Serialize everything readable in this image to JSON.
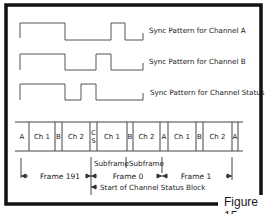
{
  "sync_patterns": [
    {
      "label": "Sync Pattern for Channel A"
    },
    {
      "label": "Sync Pattern for Channel B"
    },
    {
      "label": "Sync Pattern for Channel Status"
    }
  ],
  "frame_cells": [
    {
      "label": "A"
    },
    {
      "label": "Ch 1"
    },
    {
      "label": "B"
    },
    {
      "label": "Ch 2"
    },
    {
      "label": "C\nS"
    },
    {
      "label": "Ch 1"
    },
    {
      "label": "B"
    },
    {
      "label": "Ch 2"
    },
    {
      "label": "A"
    },
    {
      "label": "Ch 1"
    },
    {
      "label": "B"
    },
    {
      "label": "Ch 2"
    },
    {
      "label": "A"
    }
  ],
  "annotations": {
    "subframe_1": "Subframe",
    "subframe_2": "Subframe",
    "frame_191": "Frame 191",
    "frame_0": "Frame 0",
    "frame_1": "Frame 1",
    "start_block": "Start of Channel Status Block"
  },
  "figure_label": "Figure 15"
}
